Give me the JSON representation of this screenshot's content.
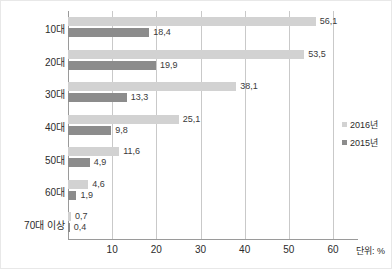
{
  "chart_data": {
    "type": "bar",
    "orientation": "horizontal",
    "title": "",
    "xlabel": "",
    "ylabel": "",
    "unit_note": "단위: %",
    "categories": [
      "10대",
      "20대",
      "30대",
      "40대",
      "50대",
      "60대",
      "70대 이상"
    ],
    "series": [
      {
        "name": "2016년",
        "color": "#d2d2d2",
        "values": [
          56.1,
          53.5,
          38.1,
          25.1,
          11.6,
          4.6,
          0.7
        ],
        "labels": [
          "56,1",
          "53,5",
          "38,1",
          "25,1",
          "11,6",
          "4,6",
          "0,7"
        ]
      },
      {
        "name": "2015년",
        "color": "#8c8c8c",
        "values": [
          18.4,
          19.9,
          13.3,
          9.8,
          4.9,
          1.9,
          0.4
        ],
        "labels": [
          "18,4",
          "19,9",
          "13,3",
          "9,8",
          "4,9",
          "1,9",
          "0,4"
        ]
      }
    ],
    "xlim": [
      0,
      60
    ],
    "xticks": [
      10,
      20,
      30,
      40,
      50,
      60
    ],
    "xtick_labels": [
      "10",
      "20",
      "30",
      "40",
      "50",
      "60"
    ],
    "grid": true,
    "grid_axis": "x",
    "legend_position": "right"
  },
  "legend": {
    "items": [
      {
        "label": "2016년",
        "color": "#d2d2d2"
      },
      {
        "label": "2015년",
        "color": "#8c8c8c"
      }
    ]
  },
  "axis": {
    "unit_note": "단위: %"
  }
}
